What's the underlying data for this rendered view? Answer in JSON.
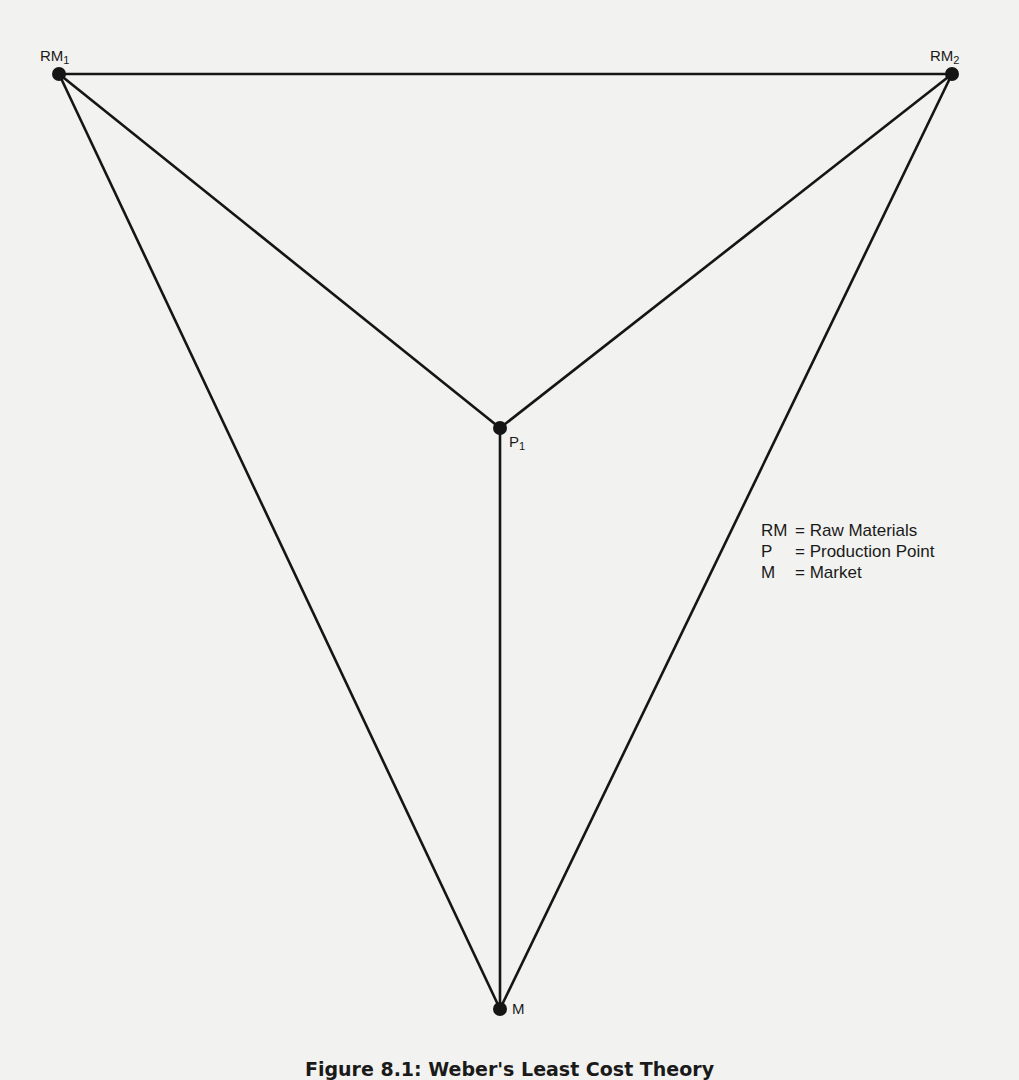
{
  "figure": {
    "caption": "Figure 8.1: Weber's Least Cost Theory",
    "nodes": [
      {
        "id": "RM1",
        "label": "RM",
        "subscript": "1",
        "x": 59,
        "y": 74
      },
      {
        "id": "RM2",
        "label": "RM",
        "subscript": "2",
        "x": 952,
        "y": 74
      },
      {
        "id": "P1",
        "label": "P",
        "subscript": "1",
        "x": 500,
        "y": 428
      },
      {
        "id": "M",
        "label": "M",
        "subscript": "",
        "x": 500,
        "y": 1009
      }
    ],
    "edges": [
      [
        "RM1",
        "RM2"
      ],
      [
        "RM1",
        "P1"
      ],
      [
        "RM2",
        "P1"
      ],
      [
        "RM1",
        "M"
      ],
      [
        "RM2",
        "M"
      ],
      [
        "P1",
        "M"
      ]
    ]
  },
  "legend": {
    "items": [
      {
        "key": "RM",
        "value": "= Raw Materials"
      },
      {
        "key": "P",
        "value": "= Production Point"
      },
      {
        "key": "M",
        "value": "= Market"
      }
    ]
  },
  "colors": {
    "line": "#151515",
    "background": "#f2f2f0"
  }
}
